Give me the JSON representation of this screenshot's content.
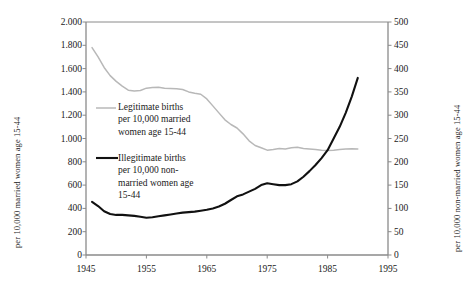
{
  "chart_data": {
    "type": "line",
    "title": "",
    "xlabel": "",
    "ylabel": "per 10,000 married women age 15-44",
    "y2label": "per 10,000 non-married women age 15-44",
    "grid": false,
    "legend_position": "inside-left",
    "xlim": [
      1945,
      1995
    ],
    "ylim": [
      0,
      2000
    ],
    "y2lim": [
      0,
      500
    ],
    "x_ticks": [
      "1945",
      "1955",
      "1965",
      "1975",
      "1985",
      "1995"
    ],
    "y_ticks_left": [
      "0",
      "200",
      "400",
      "600",
      "800",
      "1.000",
      "1.200",
      "1.400",
      "1.600",
      "1.800",
      "2.000"
    ],
    "y_ticks_right": [
      "0",
      "50",
      "100",
      "150",
      "200",
      "250",
      "300",
      "350",
      "400",
      "450",
      "500"
    ],
    "series": [
      {
        "name": "Legitimate births per 10,000 married women age 15-44",
        "axis": "left",
        "color": "#b8b8b8",
        "x": [
          1946,
          1947,
          1948,
          1949,
          1950,
          1951,
          1952,
          1953,
          1954,
          1955,
          1956,
          1957,
          1958,
          1959,
          1960,
          1961,
          1962,
          1963,
          1964,
          1965,
          1966,
          1967,
          1968,
          1969,
          1970,
          1971,
          1972,
          1973,
          1974,
          1975,
          1976,
          1977,
          1978,
          1979,
          1980,
          1981,
          1982,
          1983,
          1984,
          1985,
          1986,
          1987,
          1988,
          1989,
          1990
        ],
        "values": [
          1780,
          1700,
          1610,
          1540,
          1490,
          1450,
          1415,
          1408,
          1412,
          1432,
          1438,
          1440,
          1432,
          1430,
          1428,
          1420,
          1400,
          1388,
          1380,
          1340,
          1280,
          1220,
          1160,
          1120,
          1090,
          1040,
          980,
          940,
          920,
          900,
          905,
          915,
          910,
          920,
          925,
          915,
          910,
          905,
          900,
          898,
          900,
          905,
          910,
          912,
          910
        ]
      },
      {
        "name": "Illegitimate births per 10,000 non-married women age 15-44",
        "axis": "right",
        "color": "#111111",
        "x": [
          1946,
          1947,
          1948,
          1949,
          1950,
          1951,
          1952,
          1953,
          1954,
          1955,
          1956,
          1957,
          1958,
          1959,
          1960,
          1961,
          1962,
          1963,
          1964,
          1965,
          1966,
          1967,
          1968,
          1969,
          1970,
          1971,
          1972,
          1973,
          1974,
          1975,
          1976,
          1977,
          1978,
          1979,
          1980,
          1981,
          1982,
          1983,
          1984,
          1985,
          1986,
          1987,
          1988,
          1989,
          1990
        ],
        "values": [
          114,
          105,
          94,
          88,
          86,
          86,
          85,
          84,
          82,
          80,
          81,
          83,
          85,
          87,
          89,
          91,
          92,
          93,
          95,
          97,
          100,
          104,
          110,
          118,
          126,
          130,
          136,
          142,
          150,
          154,
          152,
          150,
          150,
          152,
          158,
          168,
          180,
          193,
          208,
          225,
          250,
          275,
          305,
          340,
          380
        ]
      }
    ],
    "annotations": [
      {
        "name": "legend-legitimate",
        "text": "Legitimate births\nper 10,000 married\nwomen age 15-44"
      },
      {
        "name": "legend-illegitimate",
        "text": "Illegitimate births\nper 10,000 non-\nmarried women age\n15-44"
      }
    ]
  },
  "axis_titles": {
    "left": "per 10,000 married women age 15-44",
    "right": "per 10,000 non-married women age 15-44"
  },
  "legend": {
    "legitimate": "Legitimate births\nper 10,000 married\nwomen age 15-44",
    "illegitimate": "Illegitimate births\nper 10,000 non-\nmarried women age\n15-44"
  },
  "colors": {
    "legitimate_line": "#b8b8b8",
    "illegitimate_line": "#111111",
    "frame": "#8a8a8a",
    "text": "#1a1a1a"
  }
}
